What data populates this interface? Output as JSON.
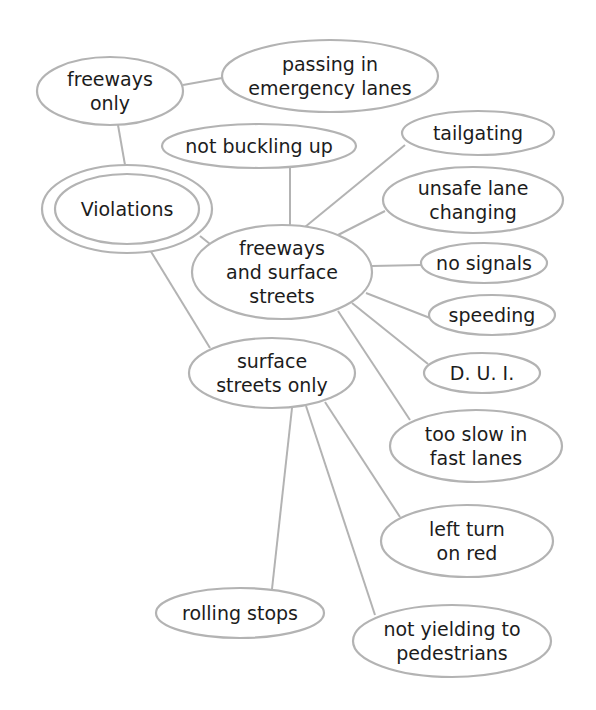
{
  "diagram": {
    "type": "concept-map",
    "colors": {
      "stroke": "#b3b3b3",
      "text": "#1c1c1c",
      "background": "#ffffff"
    },
    "root": "violations",
    "nodes": [
      {
        "id": "violations",
        "lines": [
          "Violations"
        ],
        "cx": 127,
        "cy": 209,
        "rx": 72,
        "ry": 35,
        "double": true,
        "ox": 85,
        "oy": 44
      },
      {
        "id": "freeways_only",
        "lines": [
          "freeways",
          "only"
        ],
        "cx": 110,
        "cy": 91,
        "rx": 73,
        "ry": 34
      },
      {
        "id": "passing_emergency",
        "lines": [
          "passing in",
          "emergency lanes"
        ],
        "cx": 330,
        "cy": 76,
        "rx": 108,
        "ry": 36
      },
      {
        "id": "not_buckling",
        "lines": [
          "not buckling up"
        ],
        "cx": 259,
        "cy": 146,
        "rx": 97,
        "ry": 22
      },
      {
        "id": "freeways_surface",
        "lines": [
          "freeways",
          "and surface",
          "streets"
        ],
        "cx": 282,
        "cy": 272,
        "rx": 90,
        "ry": 47
      },
      {
        "id": "tailgating",
        "lines": [
          "tailgating"
        ],
        "cx": 478,
        "cy": 133,
        "rx": 76,
        "ry": 22
      },
      {
        "id": "unsafe_lane",
        "lines": [
          "unsafe lane",
          "changing"
        ],
        "cx": 473,
        "cy": 200,
        "rx": 90,
        "ry": 33
      },
      {
        "id": "no_signals",
        "lines": [
          "no signals"
        ],
        "cx": 484,
        "cy": 263,
        "rx": 63,
        "ry": 20
      },
      {
        "id": "speeding",
        "lines": [
          "speeding"
        ],
        "cx": 492,
        "cy": 315,
        "rx": 63,
        "ry": 20
      },
      {
        "id": "dui",
        "lines": [
          "D. U. I."
        ],
        "cx": 482,
        "cy": 373,
        "rx": 58,
        "ry": 20
      },
      {
        "id": "too_slow",
        "lines": [
          "too slow in",
          "fast lanes"
        ],
        "cx": 476,
        "cy": 446,
        "rx": 86,
        "ry": 36
      },
      {
        "id": "surface_only",
        "lines": [
          "surface",
          "streets only"
        ],
        "cx": 272,
        "cy": 373,
        "rx": 83,
        "ry": 35
      },
      {
        "id": "left_turn",
        "lines": [
          "left turn",
          "on red"
        ],
        "cx": 467,
        "cy": 541,
        "rx": 86,
        "ry": 36
      },
      {
        "id": "rolling_stops",
        "lines": [
          "rolling stops"
        ],
        "cx": 240,
        "cy": 613,
        "rx": 84,
        "ry": 25
      },
      {
        "id": "not_yielding",
        "lines": [
          "not yielding to",
          "pedestrians"
        ],
        "cx": 452,
        "cy": 641,
        "rx": 99,
        "ry": 36
      }
    ],
    "edges": [
      {
        "from": "violations",
        "to": "freeways_only",
        "x1": 125,
        "y1": 165,
        "x2": 118,
        "y2": 125
      },
      {
        "from": "freeways_only",
        "to": "passing_emergency",
        "x1": 183,
        "y1": 85,
        "x2": 222,
        "y2": 78
      },
      {
        "from": "violations",
        "to": "freeways_surface",
        "x1": 200,
        "y1": 236,
        "x2": 215,
        "y2": 248
      },
      {
        "from": "violations",
        "to": "surface_only",
        "x1": 150,
        "y1": 250,
        "x2": 210,
        "y2": 348
      },
      {
        "from": "freeways_surface",
        "to": "not_buckling",
        "x1": 290,
        "y1": 225,
        "x2": 290,
        "y2": 168
      },
      {
        "from": "freeways_surface",
        "to": "tailgating",
        "x1": 305,
        "y1": 227,
        "x2": 405,
        "y2": 145
      },
      {
        "from": "freeways_surface",
        "to": "unsafe_lane",
        "x1": 338,
        "y1": 235,
        "x2": 385,
        "y2": 211
      },
      {
        "from": "freeways_surface",
        "to": "no_signals",
        "x1": 372,
        "y1": 266,
        "x2": 421,
        "y2": 265
      },
      {
        "from": "freeways_surface",
        "to": "speeding",
        "x1": 366,
        "y1": 293,
        "x2": 430,
        "y2": 318
      },
      {
        "from": "freeways_surface",
        "to": "dui",
        "x1": 352,
        "y1": 303,
        "x2": 428,
        "y2": 364
      },
      {
        "from": "freeways_surface",
        "to": "too_slow",
        "x1": 338,
        "y1": 311,
        "x2": 410,
        "y2": 420
      },
      {
        "from": "surface_only",
        "to": "rolling_stops",
        "x1": 292,
        "y1": 408,
        "x2": 272,
        "y2": 589
      },
      {
        "from": "surface_only",
        "to": "not_yielding",
        "x1": 306,
        "y1": 406,
        "x2": 375,
        "y2": 615
      },
      {
        "from": "surface_only",
        "to": "left_turn",
        "x1": 325,
        "y1": 402,
        "x2": 400,
        "y2": 517
      }
    ]
  }
}
